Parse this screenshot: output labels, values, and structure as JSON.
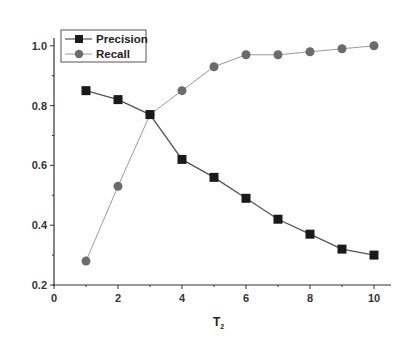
{
  "chart_data": {
    "type": "line",
    "title": "",
    "xlabel": "T",
    "xlabel_subscript": "2",
    "ylabel": "",
    "x": [
      1,
      2,
      3,
      4,
      5,
      6,
      7,
      8,
      9,
      10
    ],
    "series": [
      {
        "name": "Precision",
        "marker": "square",
        "color": "#1a1a1a",
        "line_color": "#555555",
        "values": [
          0.85,
          0.82,
          0.77,
          0.62,
          0.56,
          0.49,
          0.42,
          0.37,
          0.32,
          0.3
        ]
      },
      {
        "name": "Recall",
        "marker": "circle",
        "color": "#6b6b6b",
        "line_color": "#9a9a9a",
        "values": [
          0.28,
          0.53,
          0.77,
          0.85,
          0.93,
          0.97,
          0.97,
          0.98,
          0.99,
          1.0
        ]
      }
    ],
    "xlim": [
      0,
      10.5
    ],
    "ylim": [
      0.2,
      1.05
    ],
    "xticks": [
      0,
      2,
      4,
      6,
      8,
      10
    ],
    "xtick_labels": [
      "0",
      "2",
      "4",
      "6",
      "8",
      "10"
    ],
    "yticks": [
      0.2,
      0.4,
      0.6,
      0.8,
      1.0
    ],
    "ytick_labels": [
      "0.2",
      "0.4",
      "0.6",
      "0.8",
      "1.0"
    ],
    "y_minor_ticks": [
      0.3,
      0.5,
      0.7,
      0.9
    ],
    "x_minor_ticks": [
      1,
      3,
      5,
      7,
      9
    ],
    "grid": false,
    "legend_position": "upper-left"
  },
  "legend": {
    "items": [
      {
        "label": "Precision"
      },
      {
        "label": "Recall"
      }
    ]
  },
  "axes": {
    "x_title": "T",
    "x_title_sub": "2"
  }
}
